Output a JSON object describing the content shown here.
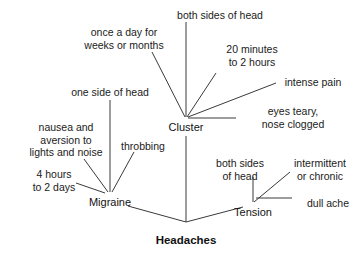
{
  "diagram": {
    "type": "concept-map",
    "title": "Headaches",
    "background_color": "#ffffff",
    "line_color": "#3a3a3a",
    "text_color": "#1a1a1a",
    "root": {
      "label": "Headaches",
      "x": 186,
      "y": 234
    },
    "branches": [
      {
        "id": "migraine",
        "label": "Migraine",
        "x": 110,
        "y": 196,
        "attributes": [
          {
            "id": "one-side-of-head",
            "label": "one side of head",
            "x": 110,
            "y": 86,
            "align": "center"
          },
          {
            "id": "nausea-aversion",
            "label": "nausea and\naversion to\nlights and noise",
            "x": 66,
            "y": 121,
            "align": "center"
          },
          {
            "id": "throbbing",
            "label": "throbbing",
            "x": 143,
            "y": 140,
            "align": "center"
          },
          {
            "id": "four-hours-to-two-days",
            "label": "4 hours\nto 2 days",
            "x": 54,
            "y": 168,
            "align": "center"
          }
        ]
      },
      {
        "id": "cluster",
        "label": "Cluster",
        "x": 186,
        "y": 121,
        "attributes": [
          {
            "id": "both-sides-of-head-cluster",
            "label": "both sides of head",
            "x": 220,
            "y": 9,
            "align": "center"
          },
          {
            "id": "once-a-day",
            "label": "once a day for\nweeks or months",
            "x": 124,
            "y": 26,
            "align": "center"
          },
          {
            "id": "twenty-minutes",
            "label": "20 minutes\nto 2 hours",
            "x": 252,
            "y": 43,
            "align": "center"
          },
          {
            "id": "intense-pain",
            "label": "intense pain",
            "x": 313,
            "y": 76,
            "align": "center"
          },
          {
            "id": "eyes-teary-nose-clogged",
            "label": "eyes teary,\nnose clogged",
            "x": 293,
            "y": 105,
            "align": "center"
          }
        ]
      },
      {
        "id": "tension",
        "label": "Tension",
        "x": 253,
        "y": 206,
        "attributes": [
          {
            "id": "both-sides-of-head-tension",
            "label": "both sides\nof head",
            "x": 240,
            "y": 157,
            "align": "center"
          },
          {
            "id": "intermittent-or-chronic",
            "label": "intermittent\nor chronic",
            "x": 320,
            "y": 157,
            "align": "center"
          },
          {
            "id": "dull-ache",
            "label": "dull ache",
            "x": 328,
            "y": 197,
            "align": "center"
          }
        ]
      }
    ],
    "edges": [
      {
        "id": "edge-root-migraine",
        "from": "headaches",
        "to": "migraine",
        "x1": 186,
        "y1": 222,
        "x2": 128,
        "y2": 206
      },
      {
        "id": "edge-root-cluster",
        "from": "headaches",
        "to": "cluster",
        "x1": 186,
        "y1": 222,
        "x2": 186,
        "y2": 136
      },
      {
        "id": "edge-root-tension",
        "from": "headaches",
        "to": "tension",
        "x1": 186,
        "y1": 222,
        "x2": 243,
        "y2": 207
      },
      {
        "id": "edge-migraine-one-side",
        "x1": 110,
        "y1": 192,
        "x2": 110,
        "y2": 100
      },
      {
        "id": "edge-migraine-nausea",
        "x1": 108,
        "y1": 192,
        "x2": 84,
        "y2": 159
      },
      {
        "id": "edge-migraine-throbbing",
        "x1": 112,
        "y1": 192,
        "x2": 134,
        "y2": 152
      },
      {
        "id": "edge-migraine-4hours",
        "x1": 105,
        "y1": 193,
        "x2": 76,
        "y2": 183
      },
      {
        "id": "edge-cluster-bothsides",
        "x1": 186,
        "y1": 117,
        "x2": 186,
        "y2": 22
      },
      {
        "id": "edge-cluster-onceaday",
        "x1": 185,
        "y1": 117,
        "x2": 152,
        "y2": 52
      },
      {
        "id": "edge-cluster-20min",
        "x1": 187,
        "y1": 117,
        "x2": 216,
        "y2": 73
      },
      {
        "id": "edge-cluster-intense",
        "x1": 188,
        "y1": 117,
        "x2": 276,
        "y2": 83
      },
      {
        "id": "edge-cluster-eyes",
        "x1": 188,
        "y1": 118,
        "x2": 236,
        "y2": 118
      },
      {
        "id": "edge-tension-bothsides",
        "x1": 253,
        "y1": 202,
        "x2": 253,
        "y2": 177
      },
      {
        "id": "edge-tension-intermittent",
        "x1": 254,
        "y1": 202,
        "x2": 290,
        "y2": 172
      },
      {
        "id": "edge-tension-dullache",
        "x1": 256,
        "y1": 198,
        "x2": 292,
        "y2": 198
      }
    ]
  }
}
